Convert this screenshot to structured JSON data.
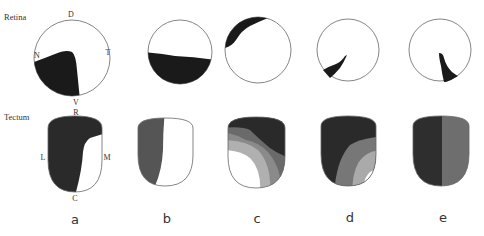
{
  "row_labels": {
    "retina": "Retina",
    "tectum": "Tectum"
  },
  "retina_axes": {
    "dorsal": "D",
    "ventral": "V",
    "nasal": "N",
    "temporal": "T"
  },
  "tectum_axes": {
    "rostral": "R",
    "caudal": "C",
    "lateral": "L",
    "medial": "M"
  },
  "colors": {
    "black": "#1a1a1a",
    "dark": "#3a3a3a",
    "mid": "#777777",
    "light": "#b0b0b0",
    "white": "#ffffff",
    "outline": "#666666"
  },
  "panels": [
    {
      "id": "a",
      "label": "a",
      "retina_region": "ventronasal quadrant",
      "tectum_region": "lateral tectum (dark), medial-caudal white"
    },
    {
      "id": "b",
      "label": "b",
      "retina_region": "ventral half",
      "tectum_region": "lateral half (gray)"
    },
    {
      "id": "c",
      "label": "c",
      "retina_region": "dorsonasal sliver",
      "tectum_region": "graded bands: dark rostral to white caudolateral"
    },
    {
      "id": "d",
      "label": "d",
      "retina_region": "small ventronasal wedge",
      "tectum_region": "graded bands: dark rostrolateral to white caudomedial"
    },
    {
      "id": "e",
      "label": "e",
      "retina_region": "small ventrotemporal wedge",
      "tectum_region": "dark lateral half, gray medial half"
    }
  ]
}
